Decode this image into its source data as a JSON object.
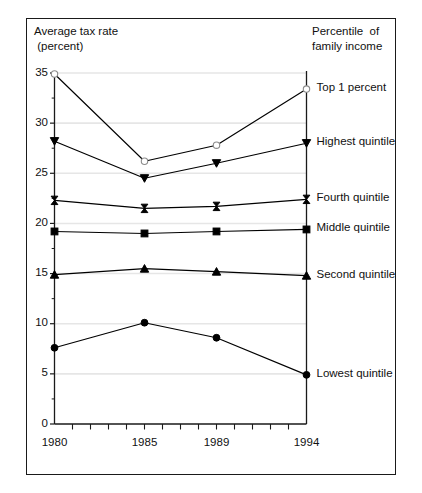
{
  "figure": {
    "axis_title_lines": [
      "Average tax rate",
      " (percent)"
    ],
    "legend_title_lines": [
      "Percentile  of",
      "family income"
    ]
  },
  "chart_data": {
    "type": "line",
    "title": "",
    "subtitle": "",
    "xlabel": "",
    "ylabel": "Average tax rate (percent)",
    "legend_title": "Percentile of family income",
    "legend_position": "right-of-plot-inline",
    "grid": true,
    "grid_axis": "y",
    "x": [
      1980,
      1985,
      1989,
      1994
    ],
    "xlim": [
      1980,
      1994
    ],
    "ylim": [
      0,
      35
    ],
    "yticks": [
      0,
      5,
      10,
      15,
      20,
      25,
      30,
      35
    ],
    "ytick_labels": [
      "0",
      "5",
      "10",
      "15",
      "20",
      "25",
      "30",
      "35"
    ],
    "xticks": [
      1980,
      1981,
      1982,
      1983,
      1984,
      1985,
      1986,
      1987,
      1988,
      1989,
      1990,
      1991,
      1992,
      1993,
      1994
    ],
    "xtick_labels_shown": [
      "1980",
      "1985",
      "1989",
      "1994"
    ],
    "xtick_labels_shown_at": [
      1980,
      1985,
      1989,
      1994
    ],
    "series": [
      {
        "name": "Top 1 percent",
        "marker": "open-circle",
        "values": [
          34.9,
          26.2,
          27.8,
          33.4
        ],
        "color": "#000000"
      },
      {
        "name": "Highest quintile",
        "marker": "down-triangle",
        "values": [
          28.2,
          24.5,
          26.0,
          28.0
        ],
        "color": "#000000"
      },
      {
        "name": "Fourth quintile",
        "marker": "bowtie",
        "values": [
          22.3,
          21.5,
          21.7,
          22.4
        ],
        "color": "#000000"
      },
      {
        "name": "Middle quintile",
        "marker": "filled-square",
        "values": [
          19.2,
          19.0,
          19.2,
          19.4
        ],
        "color": "#000000"
      },
      {
        "name": "Second quintile",
        "marker": "up-triangle",
        "values": [
          14.9,
          15.5,
          15.2,
          14.8
        ],
        "color": "#000000"
      },
      {
        "name": "Lowest quintile",
        "marker": "filled-circle",
        "values": [
          7.6,
          10.1,
          8.6,
          4.9
        ],
        "color": "#000000"
      }
    ]
  }
}
